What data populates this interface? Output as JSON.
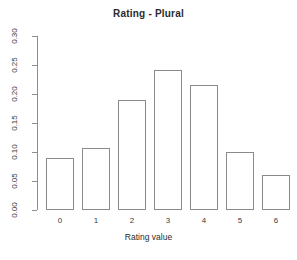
{
  "chart_data": {
    "type": "bar",
    "title": "Rating - Plural",
    "xlabel": "Rating value",
    "ylabel": "",
    "categories": [
      "0",
      "1",
      "2",
      "3",
      "4",
      "5",
      "6"
    ],
    "values": [
      0.09,
      0.107,
      0.19,
      0.242,
      0.216,
      0.1,
      0.06
    ],
    "ylim": [
      0.0,
      0.3
    ],
    "yticks": [
      0.0,
      0.05,
      0.1,
      0.15,
      0.2,
      0.25,
      0.3
    ],
    "ytick_labels": [
      "0.00",
      "0.05",
      "0.10",
      "0.15",
      "0.20",
      "0.25",
      "0.30"
    ],
    "grid": false,
    "legend": false,
    "bar_fill_color": "#ffffff",
    "bar_border_color": "#8a8a8a",
    "axis_color": "#8d8d8d",
    "background_color": "#ffffff",
    "text_color": "#2b2b2b"
  }
}
